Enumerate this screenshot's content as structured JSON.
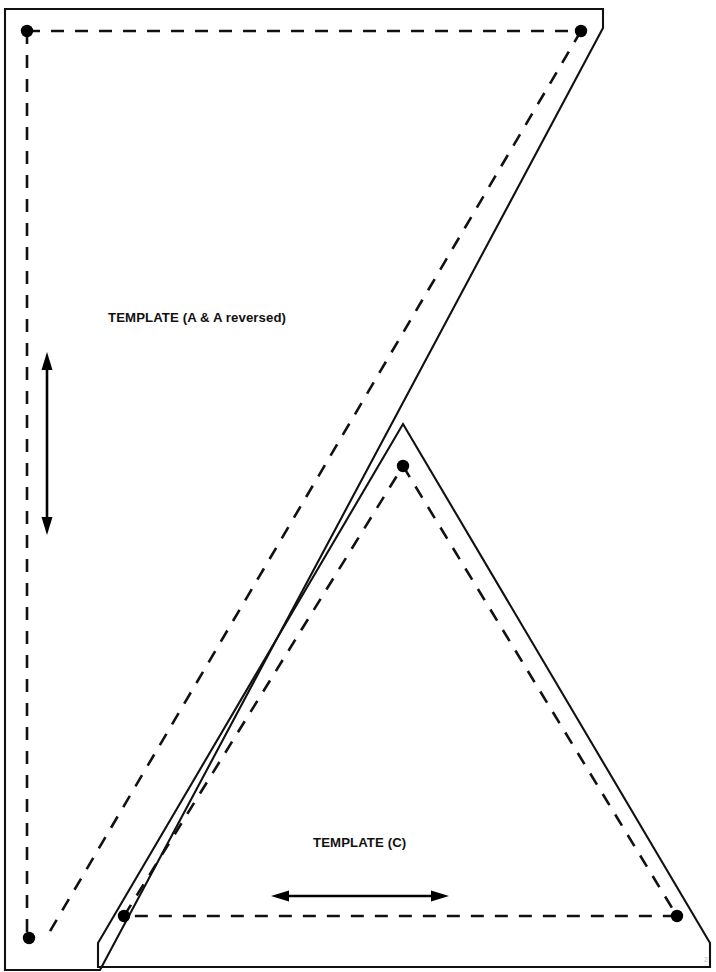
{
  "document": {
    "kind": "sewing-pattern-template-sheet",
    "background_color": "#ffffff",
    "line_color": "#111111",
    "width": 716,
    "height": 972
  },
  "templates": [
    {
      "id": "A",
      "label": "TEMPLATE (A & A reversed)",
      "label_x": 108,
      "label_y": 322,
      "cut_line_points": "5,9 603,9 603,28 100,970 5,970",
      "seam_line_points": "27,31 581,31 46,938",
      "grain_arrow": {
        "orientation": "vertical",
        "x": 47,
        "y_start": 355,
        "y_end": 532
      },
      "pivot_dots": [
        {
          "cx": 27,
          "cy": 31,
          "r": 6.2
        },
        {
          "cx": 581,
          "cy": 31,
          "r": 6.2
        },
        {
          "cx": 29,
          "cy": 938,
          "r": 6.2
        }
      ]
    },
    {
      "id": "C",
      "label": "TEMPLATE (C)",
      "label_x": 313,
      "label_y": 847,
      "cut_line_points": "403,424 710,943 710,967 98,967 98,943",
      "seam_line_points": "403,466 677,916 124,916 403,466",
      "grain_arrow": {
        "orientation": "horizontal",
        "y": 896,
        "x_start": 273,
        "x_end": 447
      },
      "pivot_dots": [
        {
          "cx": 403,
          "cy": 466,
          "r": 6.2
        },
        {
          "cx": 124,
          "cy": 916,
          "r": 6.2
        },
        {
          "cx": 677,
          "cy": 916,
          "r": 6.2
        }
      ]
    }
  ],
  "page_mark": {
    "text": "2",
    "x": 704,
    "y": 962
  }
}
